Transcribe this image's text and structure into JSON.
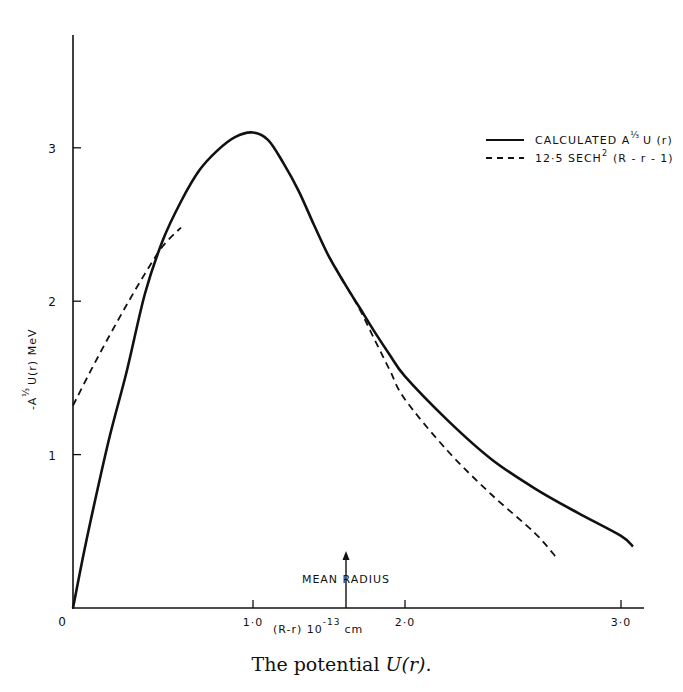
{
  "chart_data": {
    "type": "line",
    "title": "",
    "caption": "The potential U(r).",
    "xlabel": "(R-r) 10^-13 cm",
    "ylabel": "-A^1/3 U(r) MeV",
    "xlim": [
      0,
      3.2
    ],
    "ylim": [
      0,
      3.7
    ],
    "x_ticks": [
      {
        "value": 0,
        "label": "0"
      },
      {
        "value": 1.0,
        "label": "1·0"
      },
      {
        "value": 2.0,
        "label": "2·0"
      },
      {
        "value": 3.0,
        "label": "3·0"
      }
    ],
    "y_ticks": [
      {
        "value": 0,
        "label": "0"
      },
      {
        "value": 1,
        "label": "1"
      },
      {
        "value": 2,
        "label": "2"
      },
      {
        "value": 3,
        "label": "3"
      }
    ],
    "grid": false,
    "legend_position": "upper right",
    "annotations": [
      {
        "text": "MEAN RADIUS",
        "x": 1.5,
        "type": "arrow-up-to-axis"
      }
    ],
    "series": [
      {
        "name": "CALCULATED A^1/3 U(r)",
        "style": "solid",
        "x": [
          0.0,
          0.05,
          0.1,
          0.2,
          0.3,
          0.4,
          0.5,
          0.6,
          0.7,
          0.8,
          0.9,
          1.0,
          1.1,
          1.2,
          1.3,
          1.4,
          1.5,
          1.6,
          1.7,
          1.8,
          1.9,
          2.0,
          2.2,
          2.4,
          2.6,
          2.8,
          3.0,
          3.1
        ],
        "values": [
          0.0,
          0.3,
          0.58,
          1.1,
          1.55,
          2.05,
          2.4,
          2.65,
          2.85,
          2.98,
          3.07,
          3.1,
          3.05,
          2.9,
          2.72,
          2.5,
          2.29,
          2.12,
          1.96,
          1.8,
          1.65,
          1.51,
          1.22,
          0.97,
          0.78,
          0.62,
          0.47,
          0.4
        ]
      },
      {
        "name": "12·5 SECH² (R-r-1)",
        "style": "dashed",
        "x": [
          0.0,
          0.1,
          0.2,
          0.3,
          0.4,
          0.5,
          0.6,
          1.5,
          1.6,
          1.7,
          1.8,
          1.9,
          2.0,
          2.2,
          2.4,
          2.6,
          2.7
        ],
        "values": [
          1.32,
          1.55,
          1.77,
          1.98,
          2.18,
          2.36,
          2.48,
          2.29,
          2.12,
          1.95,
          1.75,
          1.55,
          1.36,
          1.02,
          0.74,
          0.49,
          0.33
        ]
      }
    ]
  },
  "legend": {
    "items": [
      {
        "label": "CALCULATED A",
        "sup": "⅓",
        "tail": "U (r)",
        "style": "solid"
      },
      {
        "label": "12·5  SECH",
        "sup": "2",
        "tail": "(R - r - 1)",
        "style": "dashed"
      }
    ]
  },
  "axes": {
    "y_title": "-A",
    "y_title_sup": "⅓",
    "y_title_tail": "U(r) MeV",
    "x_title": "(R-r) 10",
    "x_title_sup": "-13",
    "x_title_tail": "cm",
    "annotation": "MEAN RADIUS"
  },
  "caption": {
    "prefix": "The potential ",
    "math": "U(r)",
    "suffix": "."
  }
}
